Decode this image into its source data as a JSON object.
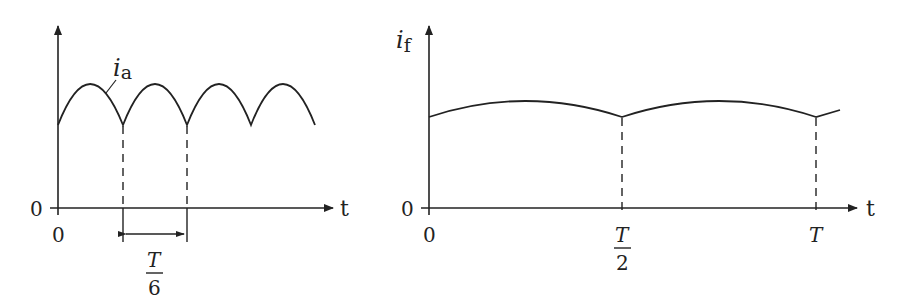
{
  "left_plot": {
    "y_label_main": "i",
    "y_label_sub": "a",
    "curve_label_main": "i",
    "curve_label_sub": "a",
    "x_axis_label": "t",
    "origin_y_label": "0",
    "origin_x_label": "0",
    "interval_numerator": "T",
    "interval_denominator": "6",
    "description": "Rectified ripple current i_a with period T/6"
  },
  "right_plot": {
    "y_label_main": "i",
    "y_label_sub": "f",
    "x_axis_label": "t",
    "origin_y_label": "0",
    "origin_x_label": "0",
    "tick1_numerator": "T",
    "tick1_denominator": "2",
    "tick2_label": "T",
    "description": "Smoothed current i_f with period T/2"
  },
  "colors": {
    "stroke": "#222222",
    "background": "#ffffff"
  }
}
